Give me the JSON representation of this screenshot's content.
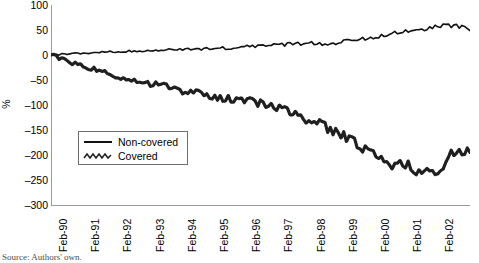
{
  "caption": "Source: Authors' own.",
  "axis": {
    "y_title": "%",
    "y_ticks": [
      100,
      50,
      0,
      -50,
      -100,
      -150,
      -200,
      -250,
      -300
    ],
    "x_ticks": [
      "Feb-90",
      "Feb-91",
      "Feb-92",
      "Feb-93",
      "Feb-94",
      "Feb-95",
      "Feb-96",
      "Feb-97",
      "Feb-98",
      "Feb-99",
      "Feb-00",
      "Feb-01",
      "Feb-02"
    ]
  },
  "legend": {
    "position": "inside-left",
    "entries": [
      {
        "label": "Non-covered",
        "style": "solid",
        "color": "#111111"
      },
      {
        "label": "Covered",
        "style": "zigzag",
        "color": "#222222"
      }
    ]
  },
  "chart_data": {
    "type": "line",
    "title": "",
    "subtitle": "",
    "xlabel": "",
    "ylabel": "%",
    "ylim": [
      -300,
      100
    ],
    "ytick_step": 50,
    "grid": false,
    "legend_position": "inside-left",
    "x_axis_kind": "monthly-time-series",
    "x_start": "Feb-90",
    "x_end": "Feb-02",
    "x": [
      "Feb-90",
      "Aug-90",
      "Feb-91",
      "Aug-91",
      "Feb-92",
      "Aug-92",
      "Feb-93",
      "Aug-93",
      "Feb-94",
      "Aug-94",
      "Feb-95",
      "Aug-95",
      "Feb-96",
      "Aug-96",
      "Feb-97",
      "Aug-97",
      "Feb-98",
      "Aug-98",
      "Feb-99",
      "Aug-99",
      "Feb-00",
      "Aug-00",
      "Feb-01",
      "Aug-01",
      "Feb-02",
      "Aug-02",
      "Feb-03"
    ],
    "series": [
      {
        "name": "Non-covered",
        "color": "#111111",
        "style": "solid",
        "values": [
          0,
          2,
          4,
          5,
          7,
          8,
          9,
          10,
          11,
          12,
          13,
          14,
          16,
          18,
          20,
          22,
          24,
          22,
          26,
          30,
          36,
          42,
          46,
          50,
          56,
          60,
          52
        ]
      },
      {
        "name": "Covered",
        "color": "#222222",
        "style": "zigzag",
        "values": [
          0,
          -12,
          -22,
          -32,
          -42,
          -52,
          -58,
          -62,
          -70,
          -76,
          -82,
          -88,
          -92,
          -96,
          -104,
          -118,
          -132,
          -142,
          -160,
          -176,
          -200,
          -218,
          -222,
          -232,
          -236,
          -196,
          -186
        ]
      }
    ],
    "annotations": []
  }
}
